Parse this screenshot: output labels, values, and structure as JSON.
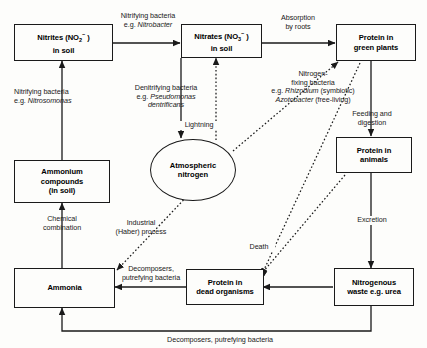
{
  "diagram": {
    "background_color": "#fdfdfb",
    "line_color": "#1a1a1a",
    "nodes": [
      {
        "id": "nitrites",
        "shape": "rect",
        "label": "Nitrites (NO2-) in soil",
        "line1": "Nitrites (NO",
        "line1_sub": "2",
        "line1_sup": "-",
        "line1_end": " )",
        "line2": "in soil"
      },
      {
        "id": "nitrates",
        "shape": "rect",
        "label": "Nitrates (NO3-) in soil",
        "line1": "Nitrates (NO",
        "line1_sub": "3",
        "line1_sup": "-",
        "line1_end": " )",
        "line2": "in soil"
      },
      {
        "id": "green_plants",
        "shape": "rect",
        "label": "Protein in green plants",
        "line1": "Protein in",
        "line2": "green plants"
      },
      {
        "id": "ammonium",
        "shape": "rect",
        "label": "Ammonium compounds (in soil)",
        "line1": "Ammonium",
        "line2": "compounds",
        "line3": "(in soil)"
      },
      {
        "id": "atmospheric_n",
        "shape": "ellipse",
        "label": "Atmospheric nitrogen",
        "line1": "Atmospheric",
        "line2": "nitrogen"
      },
      {
        "id": "animals",
        "shape": "rect",
        "label": "Protein in animals",
        "line1": "Protein in",
        "line2": "animals"
      },
      {
        "id": "ammonia",
        "shape": "rect",
        "label": "Ammonia",
        "line1": "Ammonia"
      },
      {
        "id": "dead_organisms",
        "shape": "rect",
        "label": "Protein in dead organisms",
        "line1": "Protein in",
        "line2": "dead organisms"
      },
      {
        "id": "waste",
        "shape": "rect",
        "label": "Nitrogenous waste e.g. urea",
        "line1": "Nitrogenous",
        "line2": "waste e.g. urea"
      }
    ],
    "edge_labels": {
      "nitrobacter_l1": "Nitrifying bacteria",
      "nitrobacter_l2_prefix": "e.g. ",
      "nitrobacter_l2_italic": "Nitrobacter",
      "absorption_l1": "Absorption",
      "absorption_l2": "by roots",
      "nitrosomonas_l1": "Nitrifying bacteria",
      "nitrosomonas_l2_prefix": "e.g. ",
      "nitrosomonas_l2_italic": "Nitrosomonas",
      "denitrifying_l1": "Denitrifying bacteria",
      "denitrifying_l2_prefix": "e.g. ",
      "denitrifying_l2_italic": "Pseudomonas",
      "denitrifying_l3_italic": "dentrificans",
      "lightning": "Lightning",
      "nfix_l1": "Nitrogen-",
      "nfix_l2": "fixing bacteria",
      "nfix_l3_prefix": "e.g. ",
      "nfix_l3_italic": "Rhizobium",
      "nfix_l3_suffix": " (symbiotic)",
      "nfix_l4_italic": "Azotobacter",
      "nfix_l4_suffix": " (free-living)",
      "feeding_l1": "Feeding and",
      "feeding_l2": "digestion",
      "excretion": "Excretion",
      "chemical_l1": "Chemical",
      "chemical_l2": "combination",
      "industrial_l1": "Industrial",
      "industrial_l2": "(Haber) process",
      "death": "Death",
      "decomposers_l1": "Decomposers,",
      "decomposers_l2": "putrefying bacteria",
      "decomposers_bottom": "Decomposers, putrefying bacteria"
    }
  }
}
